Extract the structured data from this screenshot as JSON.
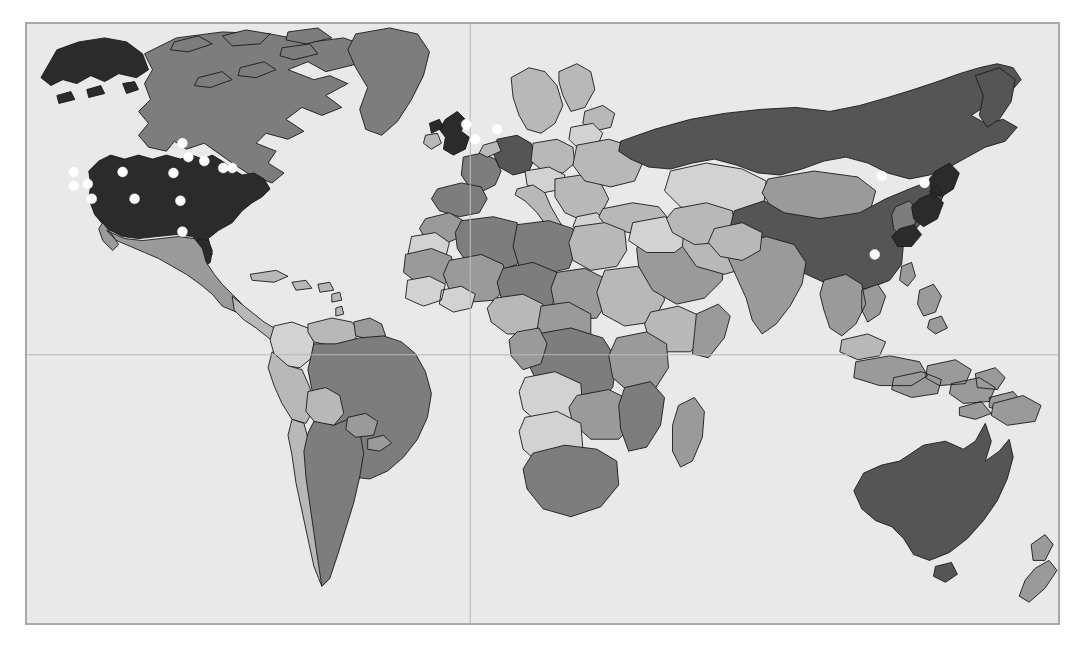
{
  "view": {
    "width": 1085,
    "height": 649,
    "background_color": "#ffffff",
    "title": "World map with site location markers"
  },
  "map": {
    "frame": {
      "x": 25,
      "y": 22,
      "width": 1035,
      "height": 603
    },
    "border_color": "#a9a9a9",
    "ocean_color": "#e9e9e9",
    "projection": "equirectangular",
    "graticule": {
      "visible": true,
      "color": "#b9b9b9",
      "lines": [
        {
          "name": "equator",
          "type": "latitude",
          "value_deg": 0,
          "y_px": 355
        },
        {
          "name": "prime-meridian",
          "type": "longitude",
          "value_deg": 0,
          "x_px": 470
        }
      ]
    },
    "shading": {
      "legend_visible": false,
      "palette": {
        "very-dark": "#2b2b2b",
        "dark": "#555555",
        "medium": "#7d7d7d",
        "medium-light": "#9a9a9a",
        "light": "#b8b8b8",
        "very-light": "#d2d2d2",
        "outline": "#1a1a1a"
      },
      "regions": [
        {
          "name": "United States",
          "shade": "very-dark"
        },
        {
          "name": "Canada",
          "shade": "medium"
        },
        {
          "name": "Greenland",
          "shade": "medium"
        },
        {
          "name": "Mexico",
          "shade": "medium-light"
        },
        {
          "name": "Central America",
          "shade": "light"
        },
        {
          "name": "Caribbean",
          "shade": "light"
        },
        {
          "name": "Brazil",
          "shade": "medium"
        },
        {
          "name": "Argentina",
          "shade": "medium"
        },
        {
          "name": "Peru",
          "shade": "light"
        },
        {
          "name": "Colombia",
          "shade": "very-light"
        },
        {
          "name": "Venezuela",
          "shade": "light"
        },
        {
          "name": "Chile",
          "shade": "light"
        },
        {
          "name": "Bolivia",
          "shade": "light"
        },
        {
          "name": "United Kingdom",
          "shade": "very-dark"
        },
        {
          "name": "France",
          "shade": "medium"
        },
        {
          "name": "Germany",
          "shade": "dark"
        },
        {
          "name": "Spain",
          "shade": "medium"
        },
        {
          "name": "Italy",
          "shade": "light"
        },
        {
          "name": "Scandinavia",
          "shade": "light"
        },
        {
          "name": "Poland",
          "shade": "light"
        },
        {
          "name": "Russia",
          "shade": "dark"
        },
        {
          "name": "Kazakhstan",
          "shade": "very-light"
        },
        {
          "name": "Mongolia",
          "shade": "medium-light"
        },
        {
          "name": "China",
          "shade": "dark"
        },
        {
          "name": "Japan",
          "shade": "very-dark"
        },
        {
          "name": "Korea",
          "shade": "medium"
        },
        {
          "name": "India",
          "shade": "medium-light"
        },
        {
          "name": "Indonesia",
          "shade": "medium-light"
        },
        {
          "name": "Australia",
          "shade": "dark"
        },
        {
          "name": "New Zealand",
          "shade": "medium-light"
        },
        {
          "name": "Algeria",
          "shade": "medium"
        },
        {
          "name": "Libya",
          "shade": "medium"
        },
        {
          "name": "Egypt",
          "shade": "light"
        },
        {
          "name": "Sudan",
          "shade": "light"
        },
        {
          "name": "Niger",
          "shade": "medium"
        },
        {
          "name": "Mali",
          "shade": "medium"
        },
        {
          "name": "Nigeria",
          "shade": "light"
        },
        {
          "name": "DR Congo",
          "shade": "medium"
        },
        {
          "name": "Ethiopia",
          "shade": "light"
        },
        {
          "name": "South Africa",
          "shade": "medium"
        },
        {
          "name": "Saudi Arabia",
          "shade": "medium-light"
        },
        {
          "name": "Madagascar",
          "shade": "medium-light"
        }
      ]
    },
    "markers": {
      "style": "white-filled-circle",
      "color": "#ffffff",
      "radius_px": 5,
      "count": 20,
      "points": [
        {
          "id": 1,
          "region": "North America",
          "x": 72,
          "y": 171
        },
        {
          "id": 2,
          "region": "North America",
          "x": 72,
          "y": 185
        },
        {
          "id": 3,
          "region": "North America",
          "x": 86,
          "y": 183
        },
        {
          "id": 4,
          "region": "North America",
          "x": 90,
          "y": 198
        },
        {
          "id": 5,
          "region": "North America",
          "x": 121,
          "y": 171
        },
        {
          "id": 6,
          "region": "North America",
          "x": 133,
          "y": 198
        },
        {
          "id": 7,
          "region": "North America",
          "x": 172,
          "y": 172
        },
        {
          "id": 8,
          "region": "North America",
          "x": 179,
          "y": 200
        },
        {
          "id": 9,
          "region": "North America",
          "x": 181,
          "y": 142
        },
        {
          "id": 10,
          "region": "North America",
          "x": 187,
          "y": 156
        },
        {
          "id": 11,
          "region": "North America",
          "x": 203,
          "y": 160
        },
        {
          "id": 12,
          "region": "North America",
          "x": 222,
          "y": 167
        },
        {
          "id": 13,
          "region": "North America",
          "x": 231,
          "y": 167
        },
        {
          "id": 14,
          "region": "North America",
          "x": 181,
          "y": 231
        },
        {
          "id": 15,
          "region": "Europe",
          "x": 466,
          "y": 123
        },
        {
          "id": 16,
          "region": "Europe",
          "x": 475,
          "y": 138
        },
        {
          "id": 17,
          "region": "Europe",
          "x": 497,
          "y": 128
        },
        {
          "id": 18,
          "region": "East Asia",
          "x": 883,
          "y": 175
        },
        {
          "id": 19,
          "region": "East Asia",
          "x": 926,
          "y": 182
        },
        {
          "id": 20,
          "region": "East Asia",
          "x": 876,
          "y": 254
        }
      ]
    }
  }
}
